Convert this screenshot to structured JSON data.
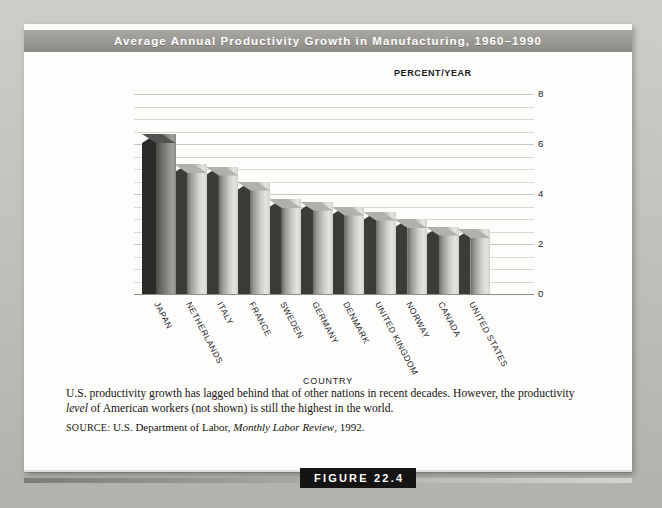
{
  "figure": {
    "title": "Average Annual Productivity Growth in Manufacturing, 1960–1990",
    "tag": "FIGURE 22.4",
    "caption_part1": "U.S. productivity growth has lagged behind that of other nations in recent decades. However, the productivity ",
    "caption_italic": "level",
    "caption_part2": " of American workers (not shown) is still the highest in the world.",
    "source_label": "SOURCE:",
    "source_text_1": " U.S. Department of Labor, ",
    "source_italic": "Monthly Labor Review",
    "source_text_2": ", 1992."
  },
  "chart_data": {
    "type": "bar",
    "title": "Average Annual Productivity Growth in Manufacturing, 1960–1990",
    "xlabel": "COUNTRY",
    "ylabel": "PERCENT/YEAR",
    "categories": [
      "JAPAN",
      "NETHERLANDS",
      "ITALY",
      "FRANCE",
      "SWEDEN",
      "GERMANY",
      "DENMARK",
      "UNITED KINGDOM",
      "NORWAY",
      "CANADA",
      "UNITED STATES"
    ],
    "values": [
      6.4,
      5.2,
      5.1,
      4.5,
      3.8,
      3.7,
      3.5,
      3.3,
      3.0,
      2.7,
      2.6
    ],
    "ylim": [
      0,
      8
    ],
    "ytick_labels": [
      "0",
      "2",
      "4",
      "6",
      "8"
    ],
    "ytick_values": [
      0,
      2,
      4,
      6,
      8
    ],
    "gridline_step": 0.5,
    "grid": true,
    "legend": "none",
    "style": "3d-bars-grayscale"
  },
  "colors": {
    "title_band": "#9b9994",
    "title_text": "#ffffff",
    "page_background": "#c4c2bd",
    "sheet": "#fdfdfb",
    "gridline": "#d9d7d2",
    "bar_light": "#cfcdc8",
    "bar_dark_first": "#8e8c87",
    "figure_tag_bg": "#151413"
  }
}
